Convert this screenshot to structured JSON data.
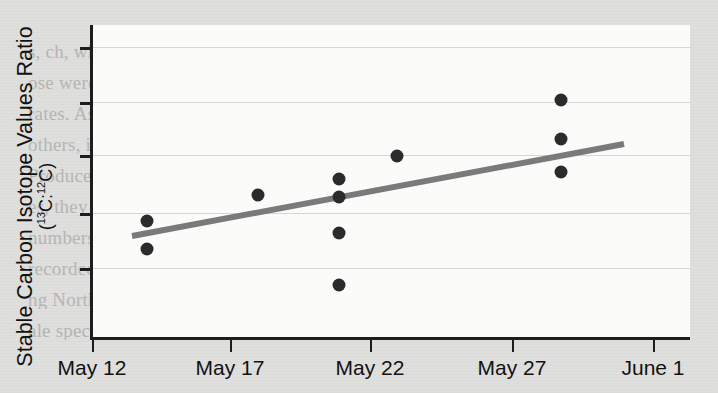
{
  "figure": {
    "background_color": "#dededc",
    "plot_background_color": "#fbfbfa",
    "axis_color": "#1d1d1d",
    "gridline_color": "#d6d6d4",
    "point_color": "#2b2b2b",
    "trendline_color": "#7a7a7a"
  },
  "axes": {
    "y_title_main": "Stable Carbon Isotope Values Ratio",
    "y_title_sub_prefix": "(",
    "y_title_sub_a_sup": "13",
    "y_title_sub_a": "C:",
    "y_title_sub_b_sup": "12",
    "y_title_sub_b": "C)",
    "x_title": ""
  },
  "bleed_text": {
    "lines": [
      "",
      "s, ch, when wild is clearly also have a flow in fix",
      "ose were returned, to them, etc the second and ea",
      "rates. As each species of while locality, the locus of con",
      "others, its numbers began a steep decline (figure 10.1 a",
      "Producers make while it was north, illegal in A",
      "es, they had been in that the limit of extinctio",
      "numbers less than 5% of the previous 25 follow",
      "recorded ever since, their number have not recovered",
      "ng North Africa or the South Pa cific. By 1940, sever",
      "ale species faced imminent extinction, and whaling int"
    ]
  },
  "chart_data": {
    "type": "scatter",
    "title": "",
    "xlabel": "",
    "ylabel": "Stable Carbon Isotope Values Ratio (13C:12C)",
    "grid": true,
    "legend": "none",
    "x_tick_labels": [
      "May 12",
      "May 17",
      "May 22",
      "May 27",
      "June 1"
    ],
    "x_tick_positions_px": [
      92,
      230,
      370,
      512,
      653
    ],
    "y_tick_labels": [
      "",
      "",
      "",
      "",
      ""
    ],
    "y_tick_positions_px": [
      47,
      102,
      155,
      213,
      268
    ],
    "xlim_px": [
      92,
      690
    ],
    "ylim_px": [
      25,
      338
    ],
    "points": [
      {
        "x_label": "May 14",
        "x_px": 147,
        "y_px": 221
      },
      {
        "x_label": "May 14",
        "x_px": 147,
        "y_px": 249
      },
      {
        "x_label": "May 18",
        "x_px": 258,
        "y_px": 195
      },
      {
        "x_label": "May 21",
        "x_px": 339,
        "y_px": 179
      },
      {
        "x_label": "May 21",
        "x_px": 339,
        "y_px": 197
      },
      {
        "x_label": "May 21",
        "x_px": 339,
        "y_px": 233
      },
      {
        "x_label": "May 21",
        "x_px": 339,
        "y_px": 285
      },
      {
        "x_label": "May 23",
        "x_px": 397,
        "y_px": 156
      },
      {
        "x_label": "May 29",
        "x_px": 561,
        "y_px": 100
      },
      {
        "x_label": "May 29",
        "x_px": 561,
        "y_px": 139
      },
      {
        "x_label": "May 29",
        "x_px": 561,
        "y_px": 172
      }
    ],
    "trendline": {
      "x1_px": 132,
      "y1_px": 236,
      "x2_px": 624,
      "y2_px": 144,
      "direction": "increasing"
    }
  }
}
